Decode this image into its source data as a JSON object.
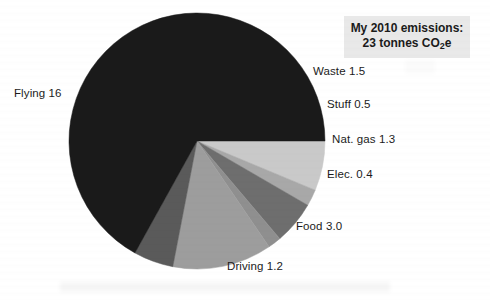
{
  "summary": {
    "line1": "My 2010 emissions:",
    "line2_prefix": "23 tonnes CO",
    "line2_sub": "2",
    "line2_suffix": "e"
  },
  "labels": {
    "flying": "Flying 16",
    "waste": "Waste 1.5",
    "stuff": "Stuff 0.5",
    "natgas": "Nat. gas 1.3",
    "elec": "Elec. 0.4",
    "food": "Food 3.0",
    "driving": "Driving 1.2"
  },
  "chart_data": {
    "type": "pie",
    "title": "My 2010 emissions: 23 tonnes CO2e",
    "unit": "tonnes CO2e",
    "total": 23,
    "legend": "none",
    "labels_position": "outside",
    "center": {
      "x": 197,
      "y": 141
    },
    "radius": 128,
    "start_angle_deg": 0,
    "direction": "clockwise",
    "categories": [
      "Waste",
      "Stuff",
      "Nat. gas",
      "Elec.",
      "Food",
      "Driving",
      "Flying"
    ],
    "values": [
      1.5,
      0.5,
      1.3,
      0.4,
      3.0,
      1.2,
      16
    ],
    "colors": [
      "#c9c9c9",
      "#a8a8a8",
      "#6e6e6e",
      "#8f8f8f",
      "#9d9d9d",
      "#5a5a5a",
      "#1a1a1a"
    ],
    "slices": [
      {
        "name": "Waste",
        "value": 1.5,
        "color": "#c9c9c9",
        "label": "Waste 1.5"
      },
      {
        "name": "Stuff",
        "value": 0.5,
        "color": "#a8a8a8",
        "label": "Stuff 0.5"
      },
      {
        "name": "Nat. gas",
        "value": 1.3,
        "color": "#6e6e6e",
        "label": "Nat. gas 1.3"
      },
      {
        "name": "Elec.",
        "value": 0.4,
        "color": "#8f8f8f",
        "label": "Elec. 0.4"
      },
      {
        "name": "Food",
        "value": 3.0,
        "color": "#9d9d9d",
        "label": "Food 3.0"
      },
      {
        "name": "Driving",
        "value": 1.2,
        "color": "#5a5a5a",
        "label": "Driving 1.2"
      },
      {
        "name": "Flying",
        "value": 16,
        "color": "#1a1a1a",
        "label": "Flying 16"
      }
    ]
  },
  "colors": {
    "background": "#ffffff",
    "text": "#1b1b1b",
    "summary_box_background": "#e9e9e9"
  }
}
